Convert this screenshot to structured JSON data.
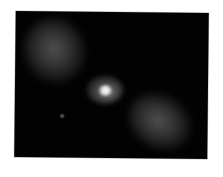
{
  "image": {
    "description": "Grayscale astronomical image of a double-lobed radio galaxy: bright compact core with two diffuse lobes extending to the upper-left and lower-right, plus a faint point source at lower-left",
    "background_color": "#ffffff",
    "frame_color": "#020202",
    "features": [
      {
        "name": "northwest-lobe",
        "brightness": "faint diffuse",
        "color": "#5f5f5f"
      },
      {
        "name": "central-core",
        "brightness": "bright compact",
        "color": "#ffffff"
      },
      {
        "name": "southeast-lobe",
        "brightness": "faint diffuse",
        "color": "#5f5f5f"
      },
      {
        "name": "point-source",
        "brightness": "very faint",
        "color": "#6e6e6e"
      }
    ]
  }
}
